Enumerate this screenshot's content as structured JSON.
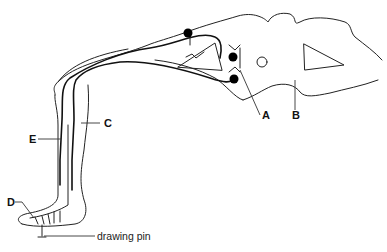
{
  "diagram": {
    "type": "reflex-arc",
    "labels": {
      "A": "A",
      "B": "B",
      "C": "C",
      "D": "D",
      "E": "E",
      "pin": "drawing pin"
    },
    "colors": {
      "line": "#222222",
      "background": "#ffffff",
      "cell_body": "#000000"
    }
  }
}
